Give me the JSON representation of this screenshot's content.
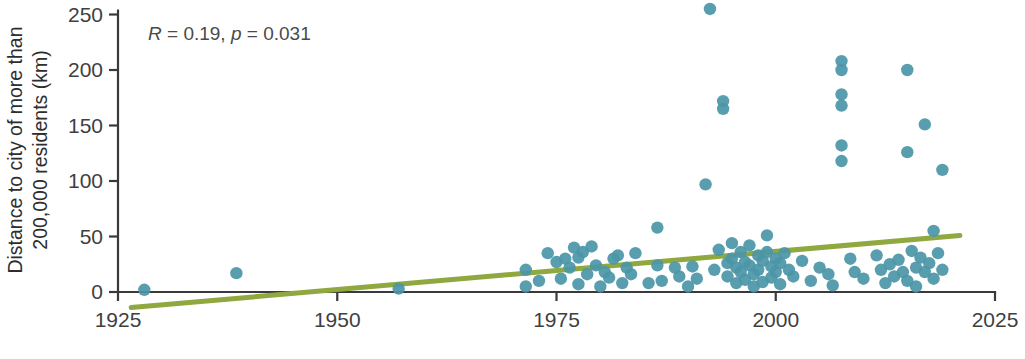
{
  "chart_data": {
    "type": "scatter",
    "title": "",
    "xlabel": "",
    "ylabel": "Distance to city of more than 200,000 residents (km)",
    "ylabel_line1": "Distance to city of more than",
    "ylabel_line2": "200,000 residents (km)",
    "xlim": [
      1925,
      2025
    ],
    "ylim": [
      -14,
      262
    ],
    "xticks": [
      1925,
      1950,
      1975,
      2000,
      2025
    ],
    "xtick_labels": [
      "1925",
      "1950",
      "1975",
      "2000",
      "2025"
    ],
    "yticks": [
      0,
      50,
      100,
      150,
      200,
      250
    ],
    "ytick_labels": [
      "0",
      "50",
      "100",
      "150",
      "200",
      "250"
    ],
    "grid": false,
    "legend": false,
    "marker_color": "#4b96a7",
    "trend_color": "#8fa83f",
    "annotation": {
      "text": "R = 0.19, p = 0.031",
      "r_symbol": "R",
      "r_value": " = 0.19, ",
      "p_symbol": "p",
      "p_value": " = 0.031",
      "statistic_r": 0.19,
      "p_value_number": 0.031
    },
    "trendline": {
      "x": [
        1926.5,
        1020.0
      ],
      "x_start": 1926.5,
      "x_end": 2021.0,
      "y_start": -14,
      "y_end": 51
    },
    "points": [
      [
        1928.0,
        2
      ],
      [
        1938.5,
        17
      ],
      [
        1957.0,
        3
      ],
      [
        1971.5,
        20
      ],
      [
        1971.5,
        5
      ],
      [
        1973.0,
        10
      ],
      [
        1974.0,
        35
      ],
      [
        1975.0,
        27
      ],
      [
        1975.5,
        12
      ],
      [
        1976.0,
        30
      ],
      [
        1976.5,
        22
      ],
      [
        1977.0,
        40
      ],
      [
        1977.5,
        31
      ],
      [
        1977.5,
        7
      ],
      [
        1978.0,
        36
      ],
      [
        1978.5,
        16
      ],
      [
        1979.0,
        41
      ],
      [
        1979.5,
        24
      ],
      [
        1980.0,
        5
      ],
      [
        1980.5,
        18
      ],
      [
        1981.0,
        13
      ],
      [
        1981.5,
        30
      ],
      [
        1982.0,
        33
      ],
      [
        1982.5,
        8
      ],
      [
        1983.0,
        22
      ],
      [
        1983.5,
        16
      ],
      [
        1984.0,
        35
      ],
      [
        1985.5,
        8
      ],
      [
        1986.5,
        58
      ],
      [
        1986.5,
        24
      ],
      [
        1987.0,
        10
      ],
      [
        1988.5,
        22
      ],
      [
        1989.0,
        14
      ],
      [
        1990.0,
        5
      ],
      [
        1990.5,
        23
      ],
      [
        1991.0,
        12
      ],
      [
        1992.0,
        97
      ],
      [
        1992.5,
        255
      ],
      [
        1993.0,
        20
      ],
      [
        1993.5,
        38
      ],
      [
        1994.0,
        172
      ],
      [
        1994.0,
        165
      ],
      [
        1994.5,
        26
      ],
      [
        1994.5,
        14
      ],
      [
        1995.0,
        44
      ],
      [
        1995.0,
        30
      ],
      [
        1995.5,
        22
      ],
      [
        1995.5,
        8
      ],
      [
        1996.0,
        36
      ],
      [
        1996.0,
        18
      ],
      [
        1996.5,
        27
      ],
      [
        1996.5,
        11
      ],
      [
        1997.0,
        42
      ],
      [
        1997.0,
        24
      ],
      [
        1997.5,
        16
      ],
      [
        1997.5,
        5
      ],
      [
        1998.0,
        33
      ],
      [
        1998.0,
        20
      ],
      [
        1998.5,
        28
      ],
      [
        1998.5,
        9
      ],
      [
        1999.0,
        51
      ],
      [
        1999.0,
        36
      ],
      [
        1999.5,
        23
      ],
      [
        1999.5,
        13
      ],
      [
        2000.0,
        30
      ],
      [
        2000.0,
        18
      ],
      [
        2000.5,
        26
      ],
      [
        2000.5,
        7
      ],
      [
        2001.0,
        35
      ],
      [
        2001.5,
        20
      ],
      [
        2002.0,
        14
      ],
      [
        2003.0,
        28
      ],
      [
        2004.0,
        10
      ],
      [
        2005.0,
        22
      ],
      [
        2006.0,
        16
      ],
      [
        2006.5,
        6
      ],
      [
        2007.5,
        208
      ],
      [
        2007.5,
        200
      ],
      [
        2007.5,
        178
      ],
      [
        2007.5,
        168
      ],
      [
        2007.5,
        132
      ],
      [
        2007.5,
        118
      ],
      [
        2008.5,
        30
      ],
      [
        2009.0,
        18
      ],
      [
        2010.0,
        12
      ],
      [
        2011.5,
        33
      ],
      [
        2012.0,
        20
      ],
      [
        2012.5,
        8
      ],
      [
        2013.0,
        25
      ],
      [
        2013.5,
        14
      ],
      [
        2014.0,
        29
      ],
      [
        2014.5,
        18
      ],
      [
        2015.0,
        200
      ],
      [
        2015.0,
        126
      ],
      [
        2015.0,
        10
      ],
      [
        2015.5,
        37
      ],
      [
        2016.0,
        22
      ],
      [
        2016.0,
        5
      ],
      [
        2016.5,
        31
      ],
      [
        2017.0,
        151
      ],
      [
        2017.0,
        18
      ],
      [
        2017.5,
        26
      ],
      [
        2018.0,
        55
      ],
      [
        2018.0,
        12
      ],
      [
        2018.5,
        35
      ],
      [
        2019.0,
        110
      ],
      [
        2019.0,
        20
      ]
    ]
  }
}
